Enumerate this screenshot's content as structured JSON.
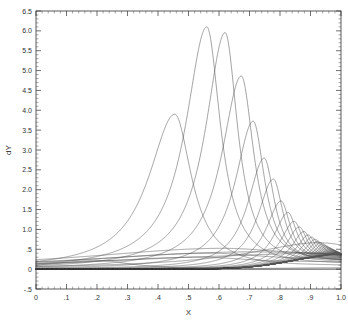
{
  "chart_data": {
    "type": "line",
    "title": "",
    "xlabel": "X",
    "ylabel": "dY",
    "xlim": [
      0.0,
      1.0
    ],
    "ylim": [
      -0.5,
      6.5
    ],
    "grid": false,
    "legend": null,
    "xticklabels": [
      "0",
      ".1",
      ".2",
      ".3",
      ".4",
      ".5",
      ".6",
      ".7",
      ".8",
      ".9",
      "1.0"
    ],
    "xtickvalues": [
      0.0,
      0.1,
      0.2,
      0.3,
      0.4,
      0.5,
      0.6,
      0.7,
      0.8,
      0.9,
      1.0
    ],
    "yticklabels": [
      "-.5",
      "0",
      ".5",
      "1.0",
      "1.5",
      "2.0",
      "2.5",
      "3.0",
      "3.5",
      "4.0",
      "4.5",
      "5.0",
      "5.5",
      "6.0",
      "6.5"
    ],
    "ytickvalues": [
      -0.5,
      0.0,
      0.5,
      1.0,
      1.5,
      2.0,
      2.5,
      3.0,
      3.5,
      4.0,
      4.5,
      5.0,
      5.5,
      6.0,
      6.5
    ],
    "minor_ticks_per_major": 5,
    "frame": "box",
    "tick_direction": "in",
    "line_color": "#555555",
    "line_width": 0.55,
    "axis_color": "#444444",
    "background": "#ffffff",
    "series_description": "Family of 30 single-peaked resonance curves; peak location shifts right and peak height rises to a maximum then decays, curves crowding together near x=1.0",
    "series": [
      {
        "name": "curve-1",
        "peak_x": 0.205,
        "peak_y": 0.22,
        "width": 0.03,
        "tail": 0.0025
      },
      {
        "name": "curve-2",
        "peak_x": 0.455,
        "peak_y": 3.9,
        "width": 0.016,
        "tail": 0.004
      },
      {
        "name": "curve-3",
        "peak_x": 0.56,
        "peak_y": 6.1,
        "width": 0.013,
        "tail": 0.006
      },
      {
        "name": "curve-4",
        "peak_x": 0.62,
        "peak_y": 5.95,
        "width": 0.012,
        "tail": 0.008
      },
      {
        "name": "curve-5",
        "peak_x": 0.673,
        "peak_y": 4.85,
        "width": 0.012,
        "tail": 0.01
      },
      {
        "name": "curve-6",
        "peak_x": 0.712,
        "peak_y": 3.7,
        "width": 0.011,
        "tail": 0.012
      },
      {
        "name": "curve-7",
        "peak_x": 0.748,
        "peak_y": 2.75,
        "width": 0.01,
        "tail": 0.014
      },
      {
        "name": "curve-8",
        "peak_x": 0.778,
        "peak_y": 2.2,
        "width": 0.0095,
        "tail": 0.016
      },
      {
        "name": "curve-9",
        "peak_x": 0.803,
        "peak_y": 1.62,
        "width": 0.009,
        "tail": 0.018
      },
      {
        "name": "curve-10",
        "peak_x": 0.826,
        "peak_y": 1.3,
        "width": 0.0085,
        "tail": 0.0195
      },
      {
        "name": "curve-11",
        "peak_x": 0.846,
        "peak_y": 1.05,
        "width": 0.008,
        "tail": 0.021
      },
      {
        "name": "curve-12",
        "peak_x": 0.863,
        "peak_y": 0.88,
        "width": 0.0075,
        "tail": 0.0225
      },
      {
        "name": "curve-13",
        "peak_x": 0.878,
        "peak_y": 0.74,
        "width": 0.007,
        "tail": 0.0235
      },
      {
        "name": "curve-14",
        "peak_x": 0.892,
        "peak_y": 0.63,
        "width": 0.0066,
        "tail": 0.0245
      },
      {
        "name": "curve-15",
        "peak_x": 0.904,
        "peak_y": 0.55,
        "width": 0.0062,
        "tail": 0.0255
      },
      {
        "name": "curve-16",
        "peak_x": 0.915,
        "peak_y": 0.48,
        "width": 0.0058,
        "tail": 0.0262
      },
      {
        "name": "curve-17",
        "peak_x": 0.924,
        "peak_y": 0.42,
        "width": 0.0054,
        "tail": 0.0268
      },
      {
        "name": "curve-18",
        "peak_x": 0.932,
        "peak_y": 0.37,
        "width": 0.005,
        "tail": 0.0272
      },
      {
        "name": "curve-19",
        "peak_x": 0.94,
        "peak_y": 0.33,
        "width": 0.0047,
        "tail": 0.0276
      },
      {
        "name": "curve-20",
        "peak_x": 0.946,
        "peak_y": 0.29,
        "width": 0.0044,
        "tail": 0.028
      },
      {
        "name": "curve-21",
        "peak_x": 0.952,
        "peak_y": 0.26,
        "width": 0.0041,
        "tail": 0.0283
      },
      {
        "name": "curve-22",
        "peak_x": 0.957,
        "peak_y": 0.23,
        "width": 0.0038,
        "tail": 0.0286
      },
      {
        "name": "curve-23",
        "peak_x": 0.962,
        "peak_y": 0.205,
        "width": 0.0035,
        "tail": 0.0288
      },
      {
        "name": "curve-24",
        "peak_x": 0.966,
        "peak_y": 0.185,
        "width": 0.0033,
        "tail": 0.029
      },
      {
        "name": "curve-25",
        "peak_x": 0.97,
        "peak_y": 0.165,
        "width": 0.0031,
        "tail": 0.0292
      },
      {
        "name": "curve-26",
        "peak_x": 0.973,
        "peak_y": 0.148,
        "width": 0.0029,
        "tail": 0.0294
      },
      {
        "name": "curve-27",
        "peak_x": 0.976,
        "peak_y": 0.133,
        "width": 0.0027,
        "tail": 0.0295
      },
      {
        "name": "curve-28",
        "peak_x": 0.979,
        "peak_y": 0.12,
        "width": 0.0025,
        "tail": 0.0296
      },
      {
        "name": "curve-29",
        "peak_x": 0.981,
        "peak_y": 0.108,
        "width": 0.0024,
        "tail": 0.0297
      },
      {
        "name": "curve-30",
        "peak_x": 0.984,
        "peak_y": 0.097,
        "width": 0.0022,
        "tail": 0.0298
      },
      {
        "name": "curve-31",
        "peak_x": 0.986,
        "peak_y": 0.088,
        "width": 0.0021,
        "tail": 0.0299
      },
      {
        "name": "curve-32",
        "peak_x": 0.988,
        "peak_y": 0.079,
        "width": 0.002,
        "tail": 0.03
      },
      {
        "name": "curve-33",
        "peak_x": 0.99,
        "peak_y": 0.071,
        "width": 0.0019,
        "tail": 0.03
      },
      {
        "name": "curve-34",
        "peak_x": 0.992,
        "peak_y": 0.064,
        "width": 0.0018,
        "tail": 0.03
      },
      {
        "name": "curve-35",
        "peak_x": 0.994,
        "peak_y": 0.057,
        "width": 0.0017,
        "tail": 0.03
      }
    ],
    "envelope": [
      {
        "name": "broad-1",
        "peak_x": 0.6,
        "peak_y": 0.52,
        "width": 0.085,
        "tail": 0.01
      },
      {
        "name": "broad-2",
        "peak_x": 0.65,
        "peak_y": 0.42,
        "width": 0.09,
        "tail": 0.012
      },
      {
        "name": "broad-3",
        "peak_x": 0.7,
        "peak_y": 0.33,
        "width": 0.095,
        "tail": 0.014
      },
      {
        "name": "broad-4",
        "peak_x": 0.56,
        "peak_y": 0.4,
        "width": 0.075,
        "tail": 0.009
      },
      {
        "name": "broad-5",
        "peak_x": 0.53,
        "peak_y": 0.3,
        "width": 0.07,
        "tail": 0.008
      },
      {
        "name": "broad-6",
        "peak_x": 0.88,
        "peak_y": 0.47,
        "width": 0.055,
        "tail": 0.02
      }
    ]
  }
}
